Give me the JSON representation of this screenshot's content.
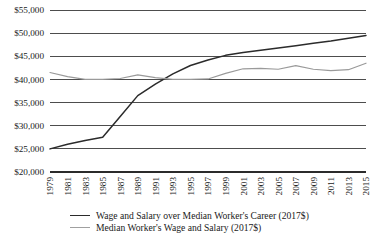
{
  "chart_data": {
    "type": "line",
    "title": "",
    "xlabel": "",
    "ylabel": "",
    "ylim": [
      20000,
      55000
    ],
    "ytick_step": 5000,
    "ytick_labels": [
      "$55,000",
      "$50,000",
      "$45,000",
      "$40,000",
      "$35,000",
      "$30,000",
      "$25,000",
      "$20,000"
    ],
    "ytick_values": [
      55000,
      50000,
      45000,
      40000,
      35000,
      30000,
      25000,
      20000
    ],
    "grid": "horizontal",
    "legend_position": "bottom",
    "x": [
      1979,
      1981,
      1983,
      1985,
      1987,
      1989,
      1991,
      1993,
      1995,
      1997,
      1999,
      2001,
      2003,
      2005,
      2007,
      2009,
      2011,
      2013,
      2015
    ],
    "categories": [
      "1979",
      "1981",
      "1983",
      "1985",
      "1987",
      "1989",
      "1991",
      "1993",
      "1995",
      "1997",
      "1999",
      "2001",
      "2003",
      "2005",
      "2007",
      "2009",
      "2011",
      "2013",
      "2015"
    ],
    "series": [
      {
        "name": "Wage and Salary over Median Worker's Career (2017$)",
        "color": "#2b2b2b",
        "width": 1.5,
        "values": [
          25000,
          26000,
          26800,
          27500,
          32000,
          36500,
          39000,
          41200,
          43000,
          44200,
          45200,
          45800,
          46300,
          46800,
          47300,
          47800,
          48300,
          48900,
          49500
        ]
      },
      {
        "name": "Median Worker's Wage and Salary (2017$)",
        "color": "#9a9a9a",
        "width": 1.2,
        "values": [
          41500,
          40600,
          40000,
          40000,
          40200,
          41000,
          40400,
          40000,
          40000,
          40100,
          41300,
          42300,
          42400,
          42200,
          43000,
          42200,
          41900,
          42100,
          43500
        ]
      }
    ]
  },
  "legend": {
    "entries": [
      {
        "label": "Wage and Salary over Median Worker's Career (2017$)",
        "color": "#2b2b2b",
        "thickness": "1.6px"
      },
      {
        "label": "Median Worker's Wage and Salary (2017$)",
        "color": "#a0a0a0",
        "thickness": "1.4px"
      }
    ]
  }
}
